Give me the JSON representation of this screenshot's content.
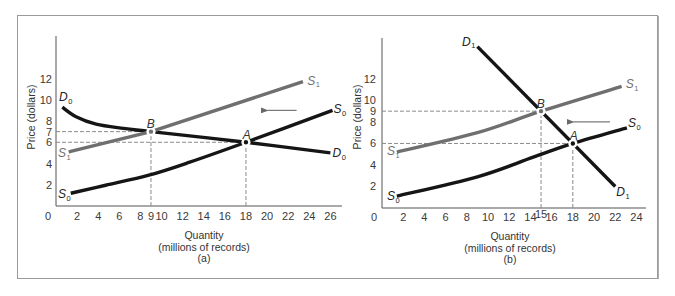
{
  "figure": {
    "panels": {
      "a": {
        "caption": "(a)",
        "xlabel": "Quantity",
        "xlabel_units": "(millions of records)",
        "ylabel": "Price  (dollars)"
      },
      "b": {
        "caption": "(b)",
        "xlabel": "Quantity",
        "xlabel_units": "(millions of records)",
        "ylabel": "Price  (dollars)"
      }
    }
  },
  "colors": {
    "background": "#ffffff",
    "frame": "#9a9a9a",
    "axis": "#555555",
    "black_curve": "#151515",
    "gray_curve": "#6f6f6f",
    "guide": "#8a8a8a",
    "arrow": "#7a7a7a",
    "label_dark": "#222222",
    "label_gray": "#6f6f6f"
  },
  "chart_data": [
    {
      "id": "a",
      "type": "line",
      "title": "(a)",
      "xlabel": "Quantity (millions of records)",
      "ylabel": "Price (dollars)",
      "xlim": [
        0,
        27.1
      ],
      "ylim": [
        0,
        16
      ],
      "grid": false,
      "legend": "none (curves labeled inline)",
      "origin_label": "0",
      "xticks": [
        2,
        4,
        6,
        8,
        9,
        10,
        12,
        14,
        16,
        18,
        20,
        22,
        24,
        26
      ],
      "yticks": [
        2,
        4,
        6,
        7,
        8,
        10,
        12
      ],
      "series": [
        {
          "name": "D0",
          "letter": "D",
          "sub": "0",
          "color": "black_curve",
          "smooth": true,
          "points": [
            [
              0.6,
              9.3
            ],
            [
              1.9,
              8.4
            ],
            [
              3.8,
              7.7
            ],
            [
              6.4,
              7.3
            ],
            [
              9,
              7
            ],
            [
              18,
              6
            ],
            [
              26,
              5
            ]
          ],
          "labels": [
            [
              0.28,
              9.88
            ],
            [
              26.2,
              4.6
            ]
          ]
        },
        {
          "name": "S0",
          "letter": "S",
          "sub": "0",
          "color": "black_curve",
          "smooth": true,
          "points": [
            [
              1.4,
              1.2
            ],
            [
              4.7,
              1.95
            ],
            [
              8.8,
              2.9
            ],
            [
              12.6,
              4.1
            ],
            [
              18,
              6
            ],
            [
              26.2,
              9
            ]
          ],
          "labels": [
            [
              0.19,
              0.75
            ],
            [
              26.3,
              8.75
            ]
          ]
        },
        {
          "name": "S1",
          "letter": "S",
          "sub": "1",
          "color": "gray_curve",
          "smooth": false,
          "points": [
            [
              1.2,
              5.1
            ],
            [
              9,
              7
            ],
            [
              23.4,
              11.7
            ]
          ],
          "labels": [
            [
              0.19,
              4.6
            ],
            [
              23.8,
              11.4
            ]
          ]
        }
      ],
      "points": [
        {
          "name": "A",
          "x": 18,
          "y": 6,
          "color": "black_curve",
          "label_at": [
            17.7,
            6.3
          ]
        },
        {
          "name": "B",
          "x": 9,
          "y": 7,
          "color": "gray_curve",
          "label_at": [
            8.6,
            7.34
          ]
        }
      ],
      "guides": [
        {
          "from": [
            0,
            7
          ],
          "to": [
            9,
            7
          ]
        },
        {
          "from": [
            0,
            6
          ],
          "to": [
            18,
            6
          ]
        },
        {
          "from": [
            9,
            0
          ],
          "to": [
            9,
            7
          ]
        },
        {
          "from": [
            18,
            0
          ],
          "to": [
            18,
            6
          ]
        }
      ],
      "arrows": [
        {
          "from": [
            22.8,
            9.0
          ],
          "to": [
            19.5,
            9.0
          ],
          "meaning": "supply shifts left from S0 to S1"
        }
      ],
      "annotations": [
        "Equilibrium A: Q=18, P=6",
        "Equilibrium B: Q=9, P=7"
      ]
    },
    {
      "id": "b",
      "type": "line",
      "title": "(b)",
      "xlabel": "Quantity (millions of records)",
      "ylabel": "Price (dollars)",
      "xlim": [
        0,
        24.9
      ],
      "ylim": [
        0,
        15.8
      ],
      "grid": false,
      "legend": "none (curves labeled inline)",
      "origin_label": "0",
      "xticks": [
        2,
        4,
        6,
        8,
        10,
        12,
        14,
        15,
        16,
        18,
        20,
        22,
        24
      ],
      "xtick_raise": {
        "15": 3
      },
      "yticks": [
        2,
        4,
        6,
        8,
        9,
        10,
        12
      ],
      "series": [
        {
          "name": "D1",
          "letter": "D",
          "sub": "1",
          "color": "black_curve",
          "smooth": false,
          "points": [
            [
              9,
              15
            ],
            [
              22,
              2
            ]
          ],
          "labels": [
            [
              7.55,
              15.06
            ],
            [
              22.1,
              1.1
            ]
          ]
        },
        {
          "name": "S0",
          "letter": "S",
          "sub": "0",
          "color": "black_curve",
          "smooth": true,
          "points": [
            [
              1.4,
              1.1
            ],
            [
              9,
              2.9
            ],
            [
              14.2,
              4.7
            ],
            [
              18,
              6
            ],
            [
              23.1,
              7.45
            ]
          ],
          "labels": [
            [
              0.47,
              0.74
            ],
            [
              23.2,
              7.5
            ]
          ]
        },
        {
          "name": "S1",
          "letter": "S",
          "sub": "1",
          "color": "gray_curve",
          "smooth": true,
          "points": [
            [
              1.4,
              5.2
            ],
            [
              9,
              7
            ],
            [
              15,
              9
            ],
            [
              22.6,
              11.3
            ]
          ],
          "labels": [
            [
              0.47,
              4.9
            ],
            [
              23.0,
              11.15
            ]
          ]
        }
      ],
      "points": [
        {
          "name": "A",
          "x": 18,
          "y": 6,
          "color": "black_curve",
          "label_at": [
            17.7,
            6.3
          ]
        },
        {
          "name": "B",
          "x": 15,
          "y": 9,
          "color": "gray_curve",
          "label_at": [
            14.6,
            9.3
          ]
        }
      ],
      "guides": [
        {
          "from": [
            0,
            9
          ],
          "to": [
            15,
            9
          ]
        },
        {
          "from": [
            0,
            6
          ],
          "to": [
            18,
            6
          ]
        },
        {
          "from": [
            15,
            0
          ],
          "to": [
            15,
            9
          ]
        },
        {
          "from": [
            18,
            0
          ],
          "to": [
            18,
            6
          ]
        }
      ],
      "arrows": [
        {
          "from": [
            21.5,
            8.0
          ],
          "to": [
            17.5,
            8.0
          ],
          "meaning": "supply shifts left from S0 to S1"
        }
      ],
      "annotations": [
        "Equilibrium A: Q=18, P=6",
        "Equilibrium B: Q=15, P=9"
      ]
    }
  ]
}
